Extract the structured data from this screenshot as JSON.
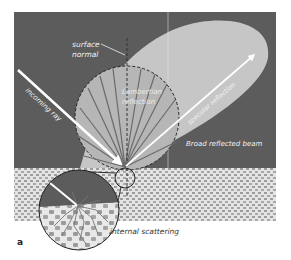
{
  "figure": {
    "panel_label": "a",
    "labels": {
      "surface_normal_line1": "surface",
      "surface_normal_line2": "normal",
      "lambertian_line1": "Lambertian",
      "lambertian_line2": "reflection",
      "incoming_ray": "incoming ray",
      "specular_reflection": "specular reflection",
      "broad_reflected_beam": "Broad reflected beam",
      "internal_scattering": "internal scattering"
    },
    "colors": {
      "background_dark": "#5c5c5c",
      "lobe_fill": "#c9c9c9",
      "lambert_fill": "#b4b4b4",
      "ground_base": "#e6e6e6",
      "ground_dots": "#9a9a9a",
      "ray_white": "#ffffff",
      "circle_stroke": "#222222"
    }
  }
}
